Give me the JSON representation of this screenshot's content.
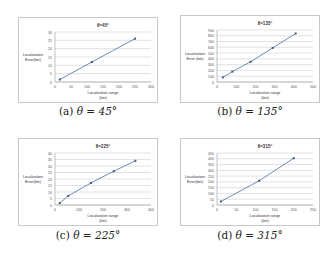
{
  "figure": {
    "captions": [
      {
        "label": "(a)",
        "text": "θ = 45°"
      },
      {
        "label": "(b)",
        "text": "θ = 135°"
      },
      {
        "label": "(c)",
        "text": "θ = 225°"
      },
      {
        "label": "(d)",
        "text": "θ = 315°"
      }
    ]
  },
  "chart_data": [
    {
      "type": "line",
      "title": "θ=45°",
      "xlabel": "Localization range (km)",
      "ylabel": "Localization Error(km)",
      "x": [
        15,
        115,
        250
      ],
      "values": [
        1.5,
        12,
        26
      ],
      "xticks": [
        0,
        50,
        100,
        150,
        200,
        250,
        300
      ],
      "yticks": [
        0,
        5,
        10,
        15,
        20,
        25,
        30
      ],
      "xlim": [
        0,
        300
      ],
      "ylim": [
        0,
        30
      ],
      "grid": true,
      "legend": "none"
    },
    {
      "type": "line",
      "title": "θ=135°",
      "xlabel": "Localization range (km)",
      "ylabel": "Localization Error (km)",
      "x": [
        30,
        80,
        175,
        290,
        410
      ],
      "values": [
        80,
        180,
        350,
        590,
        840
      ],
      "xticks": [
        0,
        100,
        200,
        300,
        400,
        500
      ],
      "yticks": [
        0,
        100,
        200,
        300,
        400,
        500,
        600,
        700,
        800,
        900
      ],
      "xlim": [
        0,
        500
      ],
      "ylim": [
        0,
        900
      ],
      "grid": true,
      "legend": "none"
    },
    {
      "type": "line",
      "title": "θ=225°",
      "xlabel": "Localization range (km)",
      "ylabel": "Localization Error(km)",
      "x": [
        20,
        55,
        150,
        245,
        335
      ],
      "values": [
        1.5,
        7,
        17,
        26,
        34
      ],
      "xticks": [
        0,
        100,
        200,
        300,
        400
      ],
      "yticks": [
        0,
        5,
        10,
        15,
        20,
        25,
        30,
        35,
        40
      ],
      "xlim": [
        0,
        400
      ],
      "ylim": [
        0,
        40
      ],
      "grid": true,
      "legend": "none"
    },
    {
      "type": "line",
      "title": "θ=315°",
      "xlabel": "Localization range (km)",
      "ylabel": "Localization Error(km)",
      "x": [
        10,
        110,
        200
      ],
      "values": [
        30,
        210,
        405
      ],
      "xticks": [
        0,
        50,
        100,
        150,
        200,
        250
      ],
      "yticks": [
        0,
        50,
        100,
        150,
        200,
        250,
        300,
        350,
        400,
        450
      ],
      "xlim": [
        0,
        250
      ],
      "ylim": [
        0,
        450
      ],
      "grid": true,
      "legend": "none"
    }
  ]
}
